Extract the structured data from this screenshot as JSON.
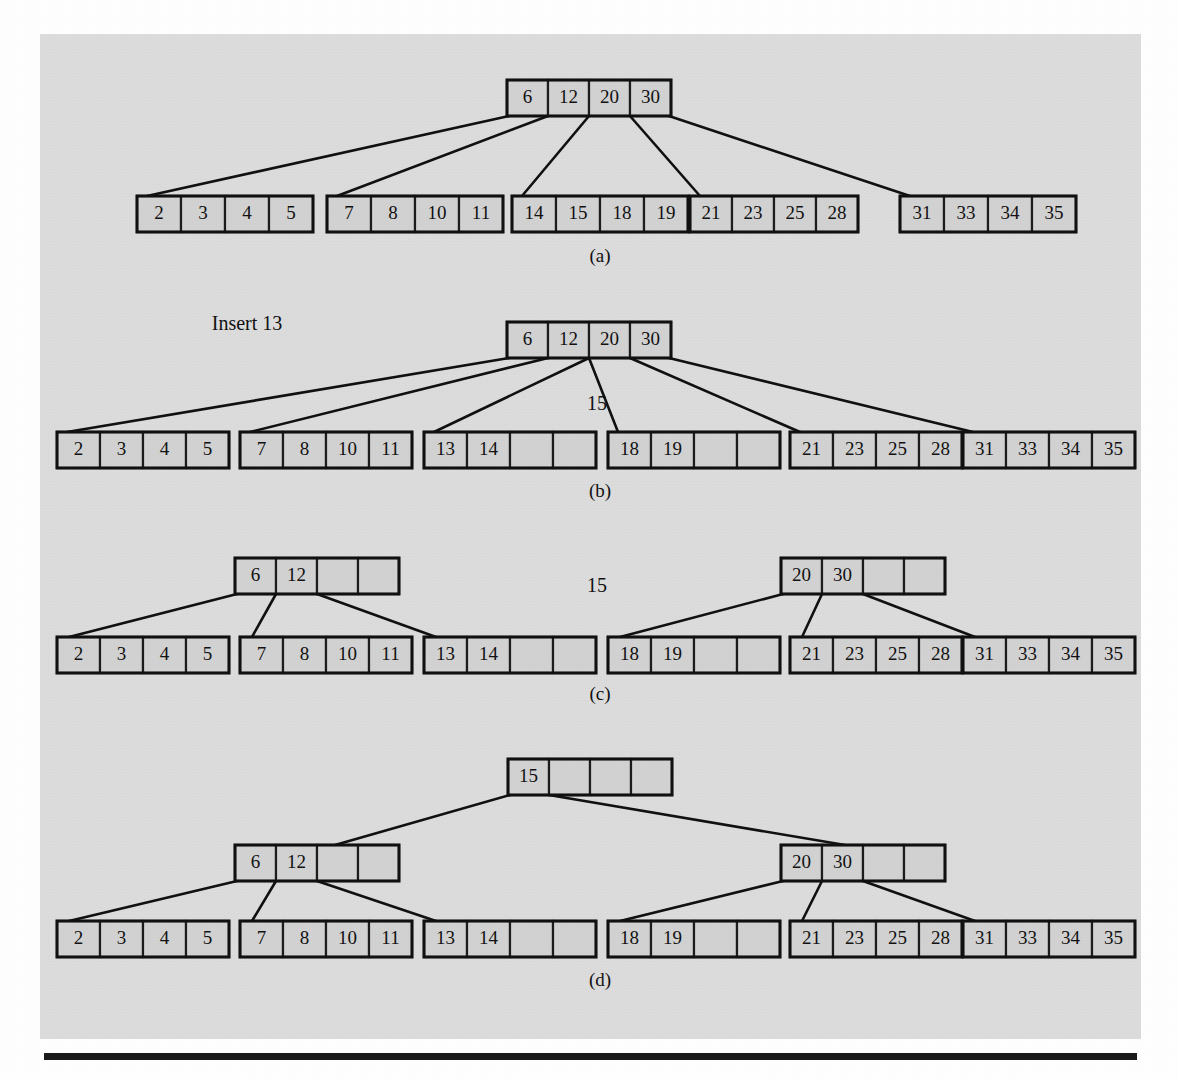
{
  "figure": {
    "kind": "b-tree-insertion-sequence",
    "panel_background": "#dcdcdc",
    "node_fill": "#d2d2d2",
    "line_color": "#101010",
    "order": 5,
    "cells_per_node": 4
  },
  "annotations": {
    "insert_label": "Insert 13",
    "promoted_b": "15",
    "promoted_c": "15"
  },
  "captions": {
    "a": "(a)",
    "b": "(b)",
    "c": "(c)",
    "d": "(d)"
  },
  "panels": {
    "a": {
      "caption": "(a)",
      "root": [
        "6",
        "12",
        "20",
        "30"
      ],
      "leaves": [
        [
          "2",
          "3",
          "4",
          "5"
        ],
        [
          "7",
          "8",
          "10",
          "11"
        ],
        [
          "14",
          "15",
          "18",
          "19"
        ],
        [
          "21",
          "23",
          "25",
          "28"
        ],
        [
          "31",
          "33",
          "34",
          "35"
        ]
      ]
    },
    "b": {
      "caption": "(b)",
      "label": "Insert 13",
      "floating": "15",
      "root": [
        "6",
        "12",
        "20",
        "30"
      ],
      "leaves": [
        [
          "2",
          "3",
          "4",
          "5"
        ],
        [
          "7",
          "8",
          "10",
          "11"
        ],
        [
          "13",
          "14",
          "",
          ""
        ],
        [
          "18",
          "19",
          "",
          ""
        ],
        [
          "21",
          "23",
          "25",
          "28"
        ],
        [
          "31",
          "33",
          "34",
          "35"
        ]
      ]
    },
    "c": {
      "caption": "(c)",
      "floating": "15",
      "internal": [
        [
          "6",
          "12",
          "",
          ""
        ],
        [
          "20",
          "30",
          "",
          ""
        ]
      ],
      "leaves": [
        [
          "2",
          "3",
          "4",
          "5"
        ],
        [
          "7",
          "8",
          "10",
          "11"
        ],
        [
          "13",
          "14",
          "",
          ""
        ],
        [
          "18",
          "19",
          "",
          ""
        ],
        [
          "21",
          "23",
          "25",
          "28"
        ],
        [
          "31",
          "33",
          "34",
          "35"
        ]
      ]
    },
    "d": {
      "caption": "(d)",
      "root": [
        "15",
        "",
        "",
        ""
      ],
      "internal": [
        [
          "6",
          "12",
          "",
          ""
        ],
        [
          "20",
          "30",
          "",
          ""
        ]
      ],
      "leaves": [
        [
          "2",
          "3",
          "4",
          "5"
        ],
        [
          "7",
          "8",
          "10",
          "11"
        ],
        [
          "13",
          "14",
          "",
          ""
        ],
        [
          "18",
          "19",
          "",
          ""
        ],
        [
          "21",
          "23",
          "25",
          "28"
        ],
        [
          "31",
          "33",
          "34",
          "35"
        ]
      ]
    }
  },
  "geometry": {
    "cell_w": 45,
    "cell_h": 36,
    "narrow_cell_w": 41,
    "rows": {
      "a_root_y": 80,
      "a_leaf_y": 196,
      "b_root_y": 322,
      "b_leaf_y": 432,
      "c_internal_y": 558,
      "c_leaf_y": 637,
      "d_root_y": 759,
      "d_internal_y": 845,
      "d_leaf_y": 921
    }
  }
}
